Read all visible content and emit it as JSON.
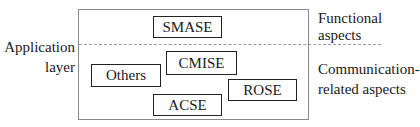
{
  "diagram": {
    "left_label": {
      "line1": "Application",
      "line2": "layer"
    },
    "right_labels": {
      "functional": {
        "line1": "Functional",
        "line2": "aspects"
      },
      "communication": {
        "line1": "Communication-",
        "line2": "related aspects"
      }
    },
    "boxes": {
      "smase": "SMASE",
      "cmise": "CMISE",
      "others": "Others",
      "acse": "ACSE",
      "rose": "ROSE"
    }
  }
}
